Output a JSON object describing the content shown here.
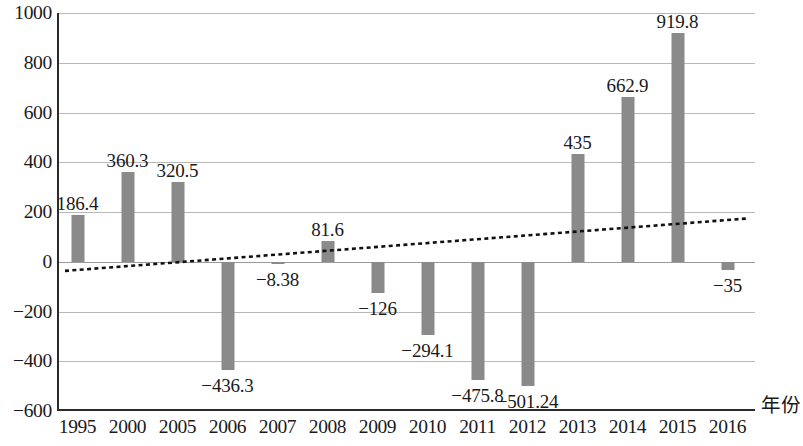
{
  "chart_data": {
    "type": "bar",
    "title": "",
    "subtitle": "",
    "xlabel": "年份",
    "ylabel": "",
    "categories": [
      "1995",
      "2000",
      "2005",
      "2006",
      "2007",
      "2008",
      "2009",
      "2010",
      "2011",
      "2012",
      "2013",
      "2014",
      "2015",
      "2016"
    ],
    "values": [
      186.4,
      360.3,
      320.5,
      -436.3,
      -8.38,
      81.6,
      -126,
      -294.1,
      -475.8,
      -501.24,
      435,
      662.9,
      919.8,
      -35
    ],
    "value_labels": [
      "186.4",
      "360.3",
      "320.5",
      "−436.3",
      "−8.38",
      "81.6",
      "−126",
      "−294.1",
      "−475.8",
      "−501.24",
      "435",
      "662.9",
      "919.8",
      "−35"
    ],
    "ylim": [
      -600,
      1000
    ],
    "ytick_values": [
      1000,
      800,
      600,
      400,
      200,
      0,
      -200,
      -400,
      -600
    ],
    "ytick_labels": [
      "1000",
      "800",
      "600",
      "400",
      "200",
      "0",
      "−200",
      "−400",
      "−600"
    ],
    "grid": true,
    "legend": "none",
    "bar_color": "#8a8a8a",
    "gridline_color": "#b8b8b8",
    "axis_color": "#2b2b2b",
    "series": [
      {
        "name": "柱形系列",
        "type": "bar",
        "values": [
          186.4,
          360.3,
          320.5,
          -436.3,
          -8.38,
          81.6,
          -126,
          -294.1,
          -475.8,
          -501.24,
          435,
          662.9,
          919.8,
          -35
        ]
      },
      {
        "name": "趋势线",
        "type": "line",
        "style": "dotted",
        "color": "#111111",
        "endpoints": [
          {
            "x_index": -0.25,
            "value": -42
          },
          {
            "x_index": 13.45,
            "value": 170
          }
        ]
      }
    ]
  }
}
